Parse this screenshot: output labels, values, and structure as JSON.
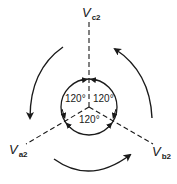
{
  "diagram": {
    "phasors": [
      {
        "id": "vc2",
        "symbol": "V",
        "subscript": "c2"
      },
      {
        "id": "va2",
        "symbol": "V",
        "subscript": "a2"
      },
      {
        "id": "vb2",
        "symbol": "V",
        "subscript": "b2"
      }
    ],
    "angles": [
      "120°",
      "120°",
      "120°"
    ],
    "rotation": "counterclockwise",
    "colors": {
      "stroke": "#1a1a1a",
      "background": "#ffffff"
    }
  }
}
